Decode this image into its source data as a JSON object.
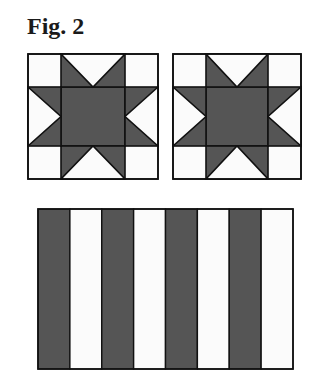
{
  "figure": {
    "title": "Fig. 2"
  },
  "colors": {
    "dark": "#555555",
    "light": "#fbfbfb",
    "line": "#111111"
  },
  "star_blocks": [
    {
      "name": "sawtooth-star-block-left",
      "x": 27,
      "y": 53,
      "width": 130,
      "height": 125
    },
    {
      "name": "sawtooth-star-block-right",
      "x": 172,
      "y": 53,
      "width": 128,
      "height": 125
    }
  ],
  "stripe_block": {
    "x": 37,
    "y": 208,
    "width": 255,
    "height": 160,
    "stripes": [
      "dark",
      "light",
      "dark",
      "light",
      "dark",
      "light",
      "dark",
      "light"
    ]
  }
}
